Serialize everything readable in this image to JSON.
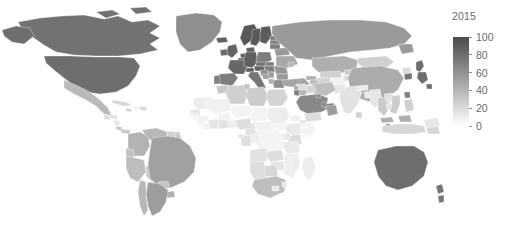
{
  "figure": {
    "background_color": "#ffffff",
    "type": "choropleth-world-map"
  },
  "legend": {
    "title": "2015",
    "orientation": "vertical",
    "ticks": [
      "100",
      "80",
      "60",
      "40",
      "20",
      "0"
    ],
    "tick_values": [
      100,
      80,
      60,
      40,
      20,
      0
    ],
    "min": 0,
    "max": 100,
    "color_low": "#ffffff",
    "color_high": "#4a4a4a",
    "title_color": "#6a6a6a",
    "label_color": "#6a6a6a"
  },
  "chart_data": {
    "type": "heatmap",
    "title": "2015",
    "xlabel": "",
    "ylabel": "",
    "legend_position": "right",
    "grid": false,
    "colorscale": "grayscale-sequential",
    "vmin": 0,
    "vmax": 100,
    "value_scale_ticks": [
      0,
      20,
      40,
      60,
      80,
      100
    ],
    "categories": [
      "Canada",
      "United States",
      "Greenland",
      "Mexico",
      "Guatemala",
      "Honduras",
      "Nicaragua",
      "Costa Rica",
      "Panama",
      "Cuba",
      "Haiti",
      "Dominican Republic",
      "Jamaica",
      "Colombia",
      "Venezuela",
      "Guyana",
      "Suriname",
      "Ecuador",
      "Peru",
      "Bolivia",
      "Brazil",
      "Paraguay",
      "Uruguay",
      "Argentina",
      "Chile",
      "Iceland",
      "Norway",
      "Sweden",
      "Finland",
      "Denmark",
      "United Kingdom",
      "Ireland",
      "Netherlands",
      "Belgium",
      "Luxembourg",
      "France",
      "Germany",
      "Switzerland",
      "Austria",
      "Spain",
      "Portugal",
      "Italy",
      "Poland",
      "Czechia",
      "Slovakia",
      "Hungary",
      "Romania",
      "Bulgaria",
      "Greece",
      "Serbia",
      "Croatia",
      "Bosnia and Herzegovina",
      "Albania",
      "Ukraine",
      "Belarus",
      "Lithuania",
      "Latvia",
      "Estonia",
      "Moldova",
      "Russia",
      "Turkey",
      "Georgia",
      "Armenia",
      "Azerbaijan",
      "Kazakhstan",
      "Uzbekistan",
      "Turkmenistan",
      "Kyrgyzstan",
      "Tajikistan",
      "Mongolia",
      "China",
      "North Korea",
      "South Korea",
      "Japan",
      "Taiwan",
      "India",
      "Pakistan",
      "Afghanistan",
      "Iran",
      "Iraq",
      "Syria",
      "Jordan",
      "Israel",
      "Lebanon",
      "Saudi Arabia",
      "United Arab Emirates",
      "Qatar",
      "Kuwait",
      "Oman",
      "Yemen",
      "Nepal",
      "Bangladesh",
      "Myanmar",
      "Thailand",
      "Laos",
      "Cambodia",
      "Vietnam",
      "Malaysia",
      "Singapore",
      "Indonesia",
      "Philippines",
      "Sri Lanka",
      "Australia",
      "New Zealand",
      "Papua New Guinea",
      "Morocco",
      "Algeria",
      "Tunisia",
      "Libya",
      "Egypt",
      "Sudan",
      "South Sudan",
      "Ethiopia",
      "Eritrea",
      "Djibouti",
      "Somalia",
      "Kenya",
      "Uganda",
      "Tanzania",
      "Rwanda",
      "Burundi",
      "Democratic Republic of the Congo",
      "Republic of the Congo",
      "Gabon",
      "Equatorial Guinea",
      "Cameroon",
      "Central African Republic",
      "Chad",
      "Niger",
      "Nigeria",
      "Benin",
      "Togo",
      "Ghana",
      "Ivory Coast",
      "Liberia",
      "Sierra Leone",
      "Guinea",
      "Guinea-Bissau",
      "Senegal",
      "Gambia",
      "Mauritania",
      "Mali",
      "Burkina Faso",
      "Angola",
      "Zambia",
      "Zimbabwe",
      "Mozambique",
      "Malawi",
      "Botswana",
      "Namibia",
      "South Africa",
      "Lesotho",
      "Eswatini",
      "Madagascar"
    ],
    "values": [
      78,
      80,
      62,
      38,
      18,
      16,
      14,
      32,
      30,
      22,
      8,
      20,
      24,
      42,
      40,
      26,
      28,
      34,
      36,
      30,
      52,
      32,
      44,
      54,
      40,
      88,
      92,
      92,
      90,
      88,
      86,
      82,
      90,
      86,
      86,
      84,
      88,
      88,
      86,
      72,
      70,
      76,
      72,
      76,
      72,
      70,
      58,
      56,
      62,
      54,
      62,
      52,
      44,
      48,
      56,
      72,
      70,
      74,
      40,
      56,
      50,
      44,
      40,
      42,
      44,
      26,
      24,
      28,
      22,
      26,
      46,
      20,
      76,
      80,
      72,
      16,
      14,
      8,
      36,
      24,
      20,
      40,
      72,
      48,
      66,
      70,
      68,
      62,
      54,
      18,
      10,
      12,
      14,
      30,
      16,
      14,
      28,
      44,
      74,
      22,
      26,
      24,
      80,
      76,
      14,
      30,
      26,
      32,
      28,
      24,
      10,
      6,
      12,
      8,
      14,
      6,
      20,
      14,
      12,
      10,
      8,
      6,
      10,
      18,
      14,
      16,
      8,
      6,
      6,
      18,
      10,
      10,
      16,
      14,
      8,
      8,
      8,
      6,
      14,
      8,
      10,
      8,
      8,
      16,
      18,
      14,
      10,
      10,
      22,
      18,
      36,
      12,
      14,
      10
    ]
  }
}
